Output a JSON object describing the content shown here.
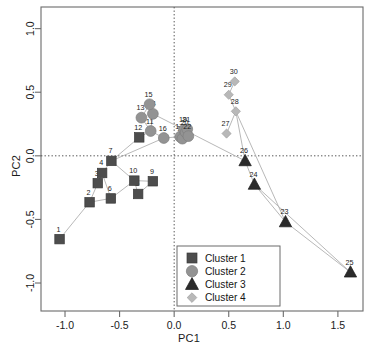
{
  "chart_data": {
    "type": "scatter",
    "title": "",
    "xlabel": "PC1",
    "ylabel": "PC2",
    "xlim": [
      -1.22,
      1.73
    ],
    "ylim": [
      -1.22,
      1.17
    ],
    "xticks": [
      "-1.0",
      "-0.5",
      "0.0",
      "0.5",
      "1.0",
      "1.5"
    ],
    "xtickvals": [
      -1.0,
      -0.5,
      0.0,
      0.5,
      1.0,
      1.5
    ],
    "yticks": [
      "-1.0",
      "-0.5",
      "0.0",
      "0.5",
      "1.0"
    ],
    "ytickvals": [
      -1.0,
      -0.5,
      0.0,
      0.5,
      1.0
    ],
    "grid": false,
    "reference_lines": [
      {
        "axis": "x",
        "value": 0.0,
        "style": "dotted"
      },
      {
        "axis": "y",
        "value": 0.0,
        "style": "dotted"
      }
    ],
    "legend_position": "bottom-center",
    "point_labels_shown": true,
    "series": [
      {
        "name": "Cluster 1",
        "marker": "square",
        "color": "#4d4d4d",
        "points": [
          {
            "label": "1",
            "x": -1.05,
            "y": -0.655
          },
          {
            "label": "2",
            "x": -0.775,
            "y": -0.365
          },
          {
            "label": "3",
            "x": -0.7,
            "y": -0.215
          },
          {
            "label": "4",
            "x": -0.66,
            "y": -0.135
          },
          {
            "label": "5",
            "x": -0.33,
            "y": -0.3
          },
          {
            "label": "6",
            "x": -0.58,
            "y": -0.335
          },
          {
            "label": "7",
            "x": -0.575,
            "y": -0.04
          },
          {
            "label": "9",
            "x": -0.195,
            "y": -0.2
          },
          {
            "label": "10",
            "x": -0.365,
            "y": -0.195
          },
          {
            "label": "12",
            "x": -0.32,
            "y": 0.145
          }
        ]
      },
      {
        "name": "Cluster 2",
        "marker": "circle",
        "color": "#939393",
        "points": [
          {
            "label": "11",
            "x": -0.215,
            "y": 0.195
          },
          {
            "label": "13",
            "x": -0.3,
            "y": 0.3
          },
          {
            "label": "14",
            "x": -0.195,
            "y": 0.33
          },
          {
            "label": "15",
            "x": -0.225,
            "y": 0.405
          },
          {
            "label": "16",
            "x": -0.095,
            "y": 0.14
          },
          {
            "label": "17",
            "x": 0.055,
            "y": 0.15
          },
          {
            "label": "18",
            "x": 0.075,
            "y": 0.135
          },
          {
            "label": "19",
            "x": 0.09,
            "y": 0.205
          },
          {
            "label": "20",
            "x": 0.105,
            "y": 0.185
          },
          {
            "label": "21",
            "x": 0.12,
            "y": 0.21
          },
          {
            "label": "22",
            "x": 0.13,
            "y": 0.155
          }
        ]
      },
      {
        "name": "Cluster 3",
        "marker": "triangle",
        "color": "#2b2b2b",
        "points": [
          {
            "label": "23",
            "x": 1.02,
            "y": -0.52
          },
          {
            "label": "24",
            "x": 0.735,
            "y": -0.225
          },
          {
            "label": "25",
            "x": 1.615,
            "y": -0.915
          },
          {
            "label": "26",
            "x": 0.65,
            "y": -0.04
          }
        ]
      },
      {
        "name": "Cluster 4",
        "marker": "diamond",
        "color": "#b8b8b8",
        "points": [
          {
            "label": "27",
            "x": 0.48,
            "y": 0.175
          },
          {
            "label": "28",
            "x": 0.565,
            "y": 0.35
          },
          {
            "label": "29",
            "x": 0.5,
            "y": 0.48
          },
          {
            "label": "30",
            "x": 0.555,
            "y": 0.585
          }
        ]
      }
    ],
    "connector_paths": [
      [
        "1",
        "2",
        "3",
        "4",
        "7",
        "12"
      ],
      [
        "2",
        "6",
        "10",
        "5",
        "9"
      ],
      [
        "6",
        "4"
      ],
      [
        "10",
        "7"
      ],
      [
        "9",
        "10"
      ],
      [
        "12",
        "11",
        "13",
        "15",
        "14",
        "11"
      ],
      [
        "11",
        "16",
        "17"
      ],
      [
        "7",
        "16"
      ],
      [
        "14",
        "19"
      ],
      [
        "27",
        "28",
        "29",
        "30"
      ],
      [
        "28",
        "26",
        "24",
        "23",
        "25"
      ],
      [
        "28",
        "23"
      ],
      [
        "24",
        "25"
      ],
      [
        "19",
        "26"
      ]
    ],
    "legend": {
      "entries": [
        {
          "label": "Cluster 1",
          "marker": "square",
          "color": "#4d4d4d"
        },
        {
          "label": "Cluster 2",
          "marker": "circle",
          "color": "#939393"
        },
        {
          "label": "Cluster 3",
          "marker": "triangle",
          "color": "#2b2b2b"
        },
        {
          "label": "Cluster 4",
          "marker": "diamond",
          "color": "#b8b8b8"
        }
      ]
    },
    "style": {
      "frame_color": "#6b6b6b",
      "connector_color": "#b0b0b0",
      "tick_label_color": "#1a1a1a",
      "background": "#ffffff"
    }
  }
}
